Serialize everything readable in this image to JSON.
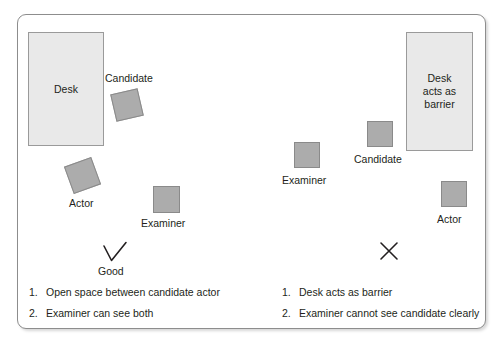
{
  "diagram": {
    "frame": {
      "name": "diagram-frame"
    },
    "colors": {
      "desk_fill": "#e9e9e9",
      "desk_border": "#9a9a9a",
      "person_fill": "#acacac",
      "person_border": "#8a8a8a",
      "frame_border": "#8d8d8d",
      "text": "#231f20"
    },
    "panels": [
      {
        "id": "good-layout",
        "verdict_icon": "check-icon",
        "verdict_label": "Good",
        "desk": {
          "label": "Desk"
        },
        "people": [
          {
            "role": "Candidate",
            "rotated": true
          },
          {
            "role": "Actor",
            "rotated": true
          },
          {
            "role": "Examiner",
            "rotated": false
          }
        ],
        "notes": [
          {
            "num": "1.",
            "text": "Open space between candidate actor"
          },
          {
            "num": "2.",
            "text": "Examiner can see both"
          }
        ]
      },
      {
        "id": "bad-layout",
        "verdict_icon": "cross-icon",
        "verdict_label": "",
        "desk": {
          "label": "Desk\nacts as\nbarrier"
        },
        "people": [
          {
            "role": "Examiner",
            "rotated": false
          },
          {
            "role": "Candidate",
            "rotated": false
          },
          {
            "role": "Actor",
            "rotated": false
          }
        ],
        "notes": [
          {
            "num": "1.",
            "text": "Desk acts as barrier"
          },
          {
            "num": "2.",
            "text": "Examiner cannot see candidate clearly"
          }
        ]
      }
    ]
  }
}
